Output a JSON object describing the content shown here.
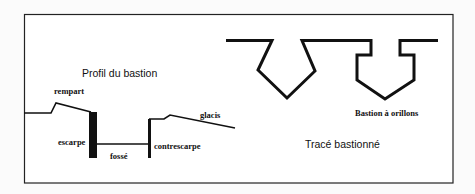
{
  "frame": {
    "x": 24,
    "y": 14,
    "width": 429,
    "height": 169,
    "border_color": "#222222",
    "background": "#ffffff"
  },
  "profile": {
    "title": "Profil du bastion",
    "labels": {
      "rempart": "rempart",
      "escarpe": "escarpe",
      "fosse": "fossé",
      "contrescarpe": "contrescarpe",
      "glacis": "glacis"
    }
  },
  "trace": {
    "title": "Tracé bastionné",
    "labels": {
      "orillons": "Bastion à orillons"
    }
  }
}
